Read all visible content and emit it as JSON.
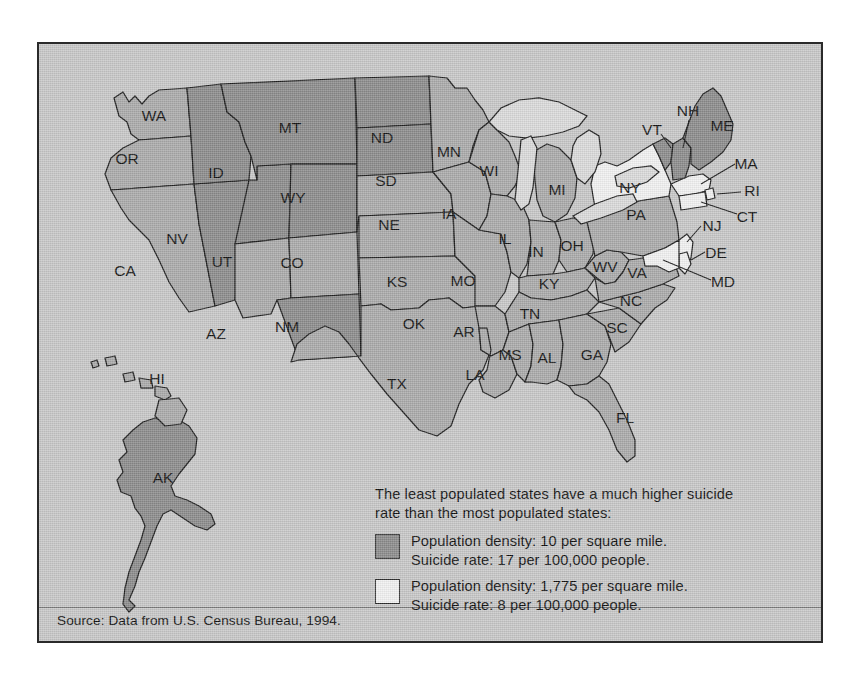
{
  "figure": {
    "background_color": "#c9c9c9",
    "border_color": "#2a2a2a"
  },
  "legend": {
    "intro_line1": "The least populated states have a much higher suicide",
    "intro_line2": "rate than the most populated states:",
    "entries": [
      {
        "swatch_color": "#8d8d8d",
        "swatch_name": "low-density-swatch",
        "line1": "Population density: 10 per square mile.",
        "line2": "Suicide rate: 17 per 100,000 people.",
        "density_value": 10,
        "suicide_rate": 17
      },
      {
        "swatch_color": "#f3f3f3",
        "swatch_name": "high-density-swatch",
        "line1": "Population density: 1,775 per square mile.",
        "line2": "Suicide rate: 8 per 100,000 people.",
        "density_value": 1775,
        "suicide_rate": 8
      }
    ]
  },
  "source": "Source: Data from U.S. Census Bureau, 1994.",
  "chart_data": {
    "type": "map",
    "title": "",
    "region": "United States",
    "categories": [
      "low-density",
      "mid-density",
      "high-density",
      "water"
    ],
    "legend_position": "bottom-right",
    "series": [
      {
        "name": "Population density: 10 per square mile / Suicide rate: 17 per 100,000",
        "fill": "#8d8d8d",
        "states": [
          "MT",
          "ID",
          "WY",
          "ND",
          "SD",
          "NV",
          "UT",
          "NM",
          "AK",
          "ME",
          "NH",
          "VT"
        ]
      },
      {
        "name": "Mid density",
        "fill": "#ababab",
        "states": [
          "WA",
          "OR",
          "CA",
          "AZ",
          "CO",
          "NE",
          "KS",
          "OK",
          "TX",
          "MN",
          "IA",
          "MO",
          "AR",
          "LA",
          "WI",
          "IL",
          "MI",
          "IN",
          "OH",
          "KY",
          "TN",
          "MS",
          "AL",
          "GA",
          "FL",
          "SC",
          "NC",
          "VA",
          "WV",
          "PA",
          "HI"
        ]
      },
      {
        "name": "Population density: 1,775 per square mile / Suicide rate: 8 per 100,000",
        "fill": "#f3f3f3",
        "states": [
          "NY",
          "NJ",
          "MA",
          "RI",
          "CT",
          "DE",
          "MD"
        ]
      }
    ],
    "state_labels": [
      {
        "code": "WA",
        "x": 115,
        "y": 73
      },
      {
        "code": "OR",
        "x": 88,
        "y": 116
      },
      {
        "code": "CA",
        "x": 86,
        "y": 228
      },
      {
        "code": "NV",
        "x": 138,
        "y": 196
      },
      {
        "code": "ID",
        "x": 177,
        "y": 130
      },
      {
        "code": "UT",
        "x": 183,
        "y": 219
      },
      {
        "code": "AZ",
        "x": 177,
        "y": 291
      },
      {
        "code": "MT",
        "x": 251,
        "y": 85
      },
      {
        "code": "WY",
        "x": 254,
        "y": 155
      },
      {
        "code": "CO",
        "x": 253,
        "y": 220
      },
      {
        "code": "NM",
        "x": 248,
        "y": 284
      },
      {
        "code": "ND",
        "x": 343,
        "y": 95
      },
      {
        "code": "SD",
        "x": 347,
        "y": 138
      },
      {
        "code": "NE",
        "x": 350,
        "y": 182
      },
      {
        "code": "KS",
        "x": 358,
        "y": 239
      },
      {
        "code": "OK",
        "x": 375,
        "y": 281
      },
      {
        "code": "TX",
        "x": 358,
        "y": 341
      },
      {
        "code": "MN",
        "x": 410,
        "y": 109
      },
      {
        "code": "IA",
        "x": 410,
        "y": 171
      },
      {
        "code": "MO",
        "x": 424,
        "y": 238
      },
      {
        "code": "AR",
        "x": 425,
        "y": 289
      },
      {
        "code": "LA",
        "x": 436,
        "y": 332
      },
      {
        "code": "WI",
        "x": 450,
        "y": 128
      },
      {
        "code": "IL",
        "x": 466,
        "y": 196
      },
      {
        "code": "MS",
        "x": 471,
        "y": 312
      },
      {
        "code": "IN",
        "x": 497,
        "y": 209
      },
      {
        "code": "MI",
        "x": 518,
        "y": 147
      },
      {
        "code": "AL",
        "x": 508,
        "y": 315
      },
      {
        "code": "TN",
        "x": 491,
        "y": 271
      },
      {
        "code": "KY",
        "x": 510,
        "y": 241
      },
      {
        "code": "OH",
        "x": 533,
        "y": 203
      },
      {
        "code": "GA",
        "x": 553,
        "y": 312
      },
      {
        "code": "SC",
        "x": 578,
        "y": 285
      },
      {
        "code": "NC",
        "x": 592,
        "y": 258
      },
      {
        "code": "WV",
        "x": 566,
        "y": 224
      },
      {
        "code": "VA",
        "x": 598,
        "y": 230
      },
      {
        "code": "FL",
        "x": 586,
        "y": 375
      },
      {
        "code": "PA",
        "x": 597,
        "y": 172
      },
      {
        "code": "NY",
        "x": 591,
        "y": 145
      },
      {
        "code": "HI",
        "x": 118,
        "y": 336
      },
      {
        "code": "AK",
        "x": 124,
        "y": 435
      }
    ],
    "callout_labels": [
      {
        "code": "NH",
        "x": 649,
        "y": 68
      },
      {
        "code": "VT",
        "x": 613,
        "y": 87
      },
      {
        "code": "ME",
        "x": 683,
        "y": 83
      },
      {
        "code": "MA",
        "x": 707,
        "y": 121
      },
      {
        "code": "RI",
        "x": 713,
        "y": 148
      },
      {
        "code": "CT",
        "x": 708,
        "y": 174
      },
      {
        "code": "NJ",
        "x": 673,
        "y": 183
      },
      {
        "code": "DE",
        "x": 677,
        "y": 210
      },
      {
        "code": "MD",
        "x": 684,
        "y": 239
      }
    ]
  }
}
